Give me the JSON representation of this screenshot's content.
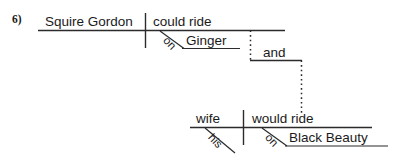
{
  "exercise": {
    "number_label": "6)"
  },
  "colors": {
    "line": "#2b2b2b",
    "text": "#1a1a1a",
    "background": "#ffffff"
  },
  "diagram": {
    "type": "reed-kellogg-sentence-diagram",
    "sentence": "Squire Gordon could ride on Ginger and his wife would ride on Black Beauty.",
    "clauses": [
      {
        "id": "upper-clause",
        "subject": "Squire Gordon",
        "predicate": "could ride",
        "prepositional_phrase": {
          "preposition": "on",
          "object": "Ginger"
        }
      },
      {
        "id": "lower-clause",
        "subject": "wife",
        "subject_modifier": "his",
        "predicate": "would ride",
        "prepositional_phrase": {
          "preposition": "on",
          "object": "Black Beauty"
        }
      }
    ],
    "conjunction": {
      "word": "and",
      "style": "dotted-connector"
    }
  }
}
